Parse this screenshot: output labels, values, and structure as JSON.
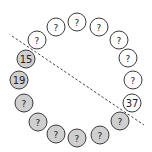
{
  "diagram": {
    "type": "circular-node-ring",
    "colors": {
      "filled": "#cfcfcf",
      "empty": "#ffffff",
      "stroke": "#3a3a3a",
      "line": "#444444"
    },
    "node_radius": 9,
    "dashed_line": {
      "x1": 12,
      "y1": 36,
      "x2": 144,
      "y2": 125
    },
    "nodes": [
      {
        "label": "?",
        "x": 77,
        "y": 22,
        "filled": false
      },
      {
        "label": "?",
        "x": 99,
        "y": 27,
        "filled": false
      },
      {
        "label": "?",
        "x": 119,
        "y": 40,
        "filled": false
      },
      {
        "label": "?",
        "x": 128,
        "y": 58,
        "filled": false
      },
      {
        "label": "?",
        "x": 133,
        "y": 80,
        "filled": false
      },
      {
        "label": "37",
        "x": 132,
        "y": 103,
        "filled": false
      },
      {
        "label": "?",
        "x": 120,
        "y": 121,
        "filled": true
      },
      {
        "label": "?",
        "x": 100,
        "y": 135,
        "filled": true
      },
      {
        "label": "?",
        "x": 77,
        "y": 138,
        "filled": true
      },
      {
        "label": "?",
        "x": 56,
        "y": 134,
        "filled": true
      },
      {
        "label": "?",
        "x": 38,
        "y": 122,
        "filled": true
      },
      {
        "label": "?",
        "x": 24,
        "y": 103,
        "filled": true
      },
      {
        "label": "19",
        "x": 19,
        "y": 80,
        "filled": true
      },
      {
        "label": "15",
        "x": 26,
        "y": 59,
        "filled": true
      },
      {
        "label": "?",
        "x": 37,
        "y": 40,
        "filled": false
      },
      {
        "label": "?",
        "x": 56,
        "y": 27,
        "filled": false
      }
    ]
  }
}
